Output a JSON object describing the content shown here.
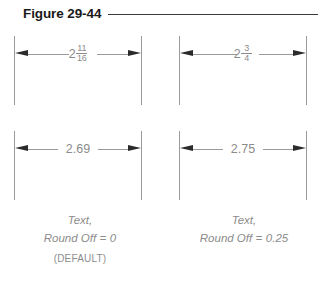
{
  "figure": {
    "title": "Figure 29-44",
    "rule_color": "#3a3a3a"
  },
  "colors": {
    "title_text": "#1a1a1a",
    "dimension_line": "#9a9a9a",
    "arrowhead": "#2b2b2b",
    "dimension_text": "#8c8c8c",
    "caption_text": "#8c8c8c",
    "background": "#ffffff"
  },
  "dimensions": [
    {
      "id": "top-left",
      "format": "fraction",
      "whole": "2",
      "numerator": "11",
      "denominator": "16",
      "full_text": "2 11/16"
    },
    {
      "id": "top-right",
      "format": "fraction",
      "whole": "2",
      "numerator": "3",
      "denominator": "4",
      "full_text": "2 3/4"
    },
    {
      "id": "bottom-left",
      "format": "decimal",
      "value": "2.69",
      "full_text": "2.69"
    },
    {
      "id": "bottom-right",
      "format": "decimal",
      "value": "2.75",
      "full_text": "2.75"
    }
  ],
  "captions": {
    "left": {
      "line1": "Text,",
      "line2_label": "Round Off",
      "line2_equals": "=",
      "line2_value": "0",
      "note": "(DEFAULT)"
    },
    "right": {
      "line1": "Text,",
      "line2_label": "Round Off",
      "line2_equals": "=",
      "line2_value": "0.25"
    }
  }
}
